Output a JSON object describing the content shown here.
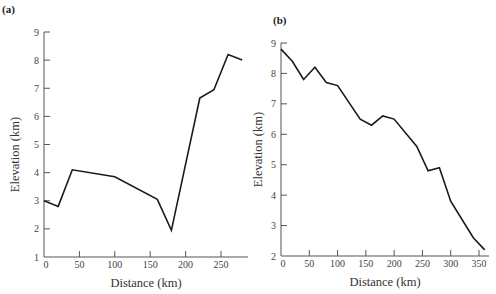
{
  "chart_data": [
    {
      "type": "line",
      "panel_label": "(a)",
      "title": "",
      "xlabel": "Distance (km)",
      "ylabel": "Elevation (km)",
      "xlim": [
        0,
        288
      ],
      "ylim": [
        1,
        9
      ],
      "xticks": [
        0,
        50,
        100,
        150,
        200,
        250
      ],
      "yticks": [
        1,
        2,
        3,
        4,
        5,
        6,
        7,
        8,
        9
      ],
      "grid": false,
      "legend": null,
      "x": [
        0,
        20,
        40,
        100,
        160,
        180,
        220,
        240,
        260,
        280
      ],
      "y": [
        3.0,
        2.8,
        4.1,
        3.85,
        3.05,
        1.95,
        6.65,
        6.95,
        8.2,
        8.0
      ]
    },
    {
      "type": "line",
      "panel_label": "(b)",
      "title": "",
      "xlabel": "Distance (km)",
      "ylabel": "Elevation (km)",
      "xlim": [
        0,
        365
      ],
      "ylim": [
        2,
        9
      ],
      "xticks": [
        0,
        50,
        100,
        150,
        200,
        250,
        300,
        350
      ],
      "yticks": [
        2,
        3,
        4,
        5,
        6,
        7,
        8,
        9
      ],
      "grid": false,
      "legend": null,
      "x": [
        0,
        20,
        40,
        60,
        80,
        100,
        140,
        160,
        180,
        200,
        240,
        260,
        280,
        300,
        340,
        360
      ],
      "y": [
        8.8,
        8.4,
        7.8,
        8.2,
        7.7,
        7.6,
        6.5,
        6.3,
        6.6,
        6.5,
        5.6,
        4.8,
        4.9,
        3.8,
        2.6,
        2.2
      ]
    }
  ],
  "layout": {
    "panels": [
      {
        "x0": 44,
        "x1": 248,
        "y0": 257,
        "y1": 32,
        "pxPerX": 0.708
      },
      {
        "x0": 281,
        "x1": 489,
        "y0": 256,
        "y1": 43,
        "pxPerX": 0.5657
      }
    ]
  }
}
